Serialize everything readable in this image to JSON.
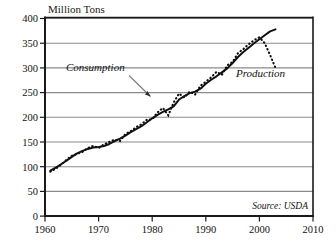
{
  "chart_data": {
    "type": "line",
    "title": "Million Tons",
    "xlabel": "",
    "ylabel": "Million Tons",
    "xlim": [
      1960,
      2010
    ],
    "ylim": [
      0,
      400
    ],
    "grid": true,
    "legend_position": "inline-annotations",
    "xticks": [
      1960,
      1970,
      1980,
      1990,
      2000,
      2010
    ],
    "yticks": [
      0,
      50,
      100,
      150,
      200,
      250,
      300,
      350,
      400
    ],
    "source_note": "Source: USDA",
    "annotations": [
      {
        "name": "consumption-label",
        "text": "Consumption",
        "x": 1972,
        "y": 318,
        "style": "italic",
        "arrow_to": {
          "x": 1980.2,
          "y": 243
        }
      },
      {
        "name": "production-label",
        "text": "Production",
        "x": 1996.5,
        "y": 268,
        "style": "italic"
      }
    ],
    "series": [
      {
        "name": "Consumption",
        "style": "solid",
        "color": "#111111",
        "x": [
          1961,
          1962,
          1963,
          1964,
          1965,
          1966,
          1967,
          1968,
          1969,
          1970,
          1971,
          1972,
          1973,
          1974,
          1975,
          1976,
          1977,
          1978,
          1979,
          1980,
          1981,
          1982,
          1983,
          1984,
          1985,
          1986,
          1987,
          1988,
          1989,
          1990,
          1991,
          1992,
          1993,
          1994,
          1995,
          1996,
          1997,
          1998,
          1999,
          2000,
          2001,
          2002,
          2003
        ],
        "values": [
          92,
          98,
          105,
          112,
          120,
          127,
          132,
          136,
          139,
          140,
          142,
          146,
          152,
          157,
          163,
          170,
          176,
          182,
          190,
          198,
          205,
          211,
          216,
          222,
          236,
          243,
          249,
          252,
          258,
          268,
          276,
          283,
          291,
          299,
          310,
          322,
          332,
          341,
          350,
          358,
          366,
          374,
          378
        ]
      },
      {
        "name": "Production",
        "style": "dotted",
        "color": "#111111",
        "x": [
          1961,
          1962,
          1963,
          1964,
          1965,
          1966,
          1967,
          1968,
          1969,
          1970,
          1971,
          1972,
          1973,
          1974,
          1975,
          1976,
          1977,
          1978,
          1979,
          1980,
          1981,
          1982,
          1983,
          1984,
          1985,
          1986,
          1987,
          1988,
          1989,
          1990,
          1991,
          1992,
          1993,
          1994,
          1995,
          1996,
          1997,
          1998,
          1999,
          2000,
          2001,
          2002,
          2003
        ],
        "values": [
          90,
          96,
          104,
          114,
          122,
          126,
          130,
          138,
          142,
          138,
          145,
          150,
          155,
          152,
          166,
          172,
          180,
          186,
          195,
          196,
          210,
          219,
          204,
          230,
          248,
          240,
          252,
          246,
          264,
          272,
          281,
          292,
          286,
          305,
          312,
          330,
          338,
          348,
          356,
          362,
          350,
          326,
          300
        ]
      }
    ]
  },
  "labels": {
    "y_axis_title": "Million Tons",
    "source": "Source: USDA",
    "consumption": "Consumption",
    "production": "Production",
    "y": [
      "400",
      "350",
      "300",
      "250",
      "200",
      "150",
      "100",
      "50",
      "0"
    ],
    "x": [
      "1960",
      "1970",
      "1980",
      "1990",
      "2000",
      "2010"
    ]
  },
  "colors": {
    "line": "#111111",
    "grid": "#8a8a8a",
    "axis": "#1a1a1a",
    "background": "#ffffff"
  }
}
